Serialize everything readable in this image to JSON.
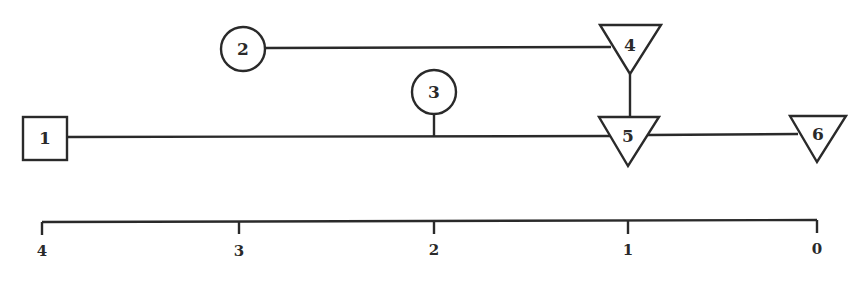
{
  "diagram": {
    "nodes": [
      {
        "id": "1",
        "label": "1",
        "shape": "square"
      },
      {
        "id": "2",
        "label": "2",
        "shape": "circle"
      },
      {
        "id": "3",
        "label": "3",
        "shape": "circle"
      },
      {
        "id": "4",
        "label": "4",
        "shape": "inverted-triangle"
      },
      {
        "id": "5",
        "label": "5",
        "shape": "inverted-triangle"
      },
      {
        "id": "6",
        "label": "6",
        "shape": "inverted-triangle"
      }
    ],
    "edges": [
      {
        "from": "1",
        "to": "5"
      },
      {
        "from": "2",
        "to": "4"
      },
      {
        "from": "3",
        "to": "main-line"
      },
      {
        "from": "4",
        "to": "5"
      },
      {
        "from": "5",
        "to": "6"
      }
    ],
    "axis": {
      "ticks": [
        "4",
        "3",
        "2",
        "1",
        "0"
      ]
    }
  }
}
